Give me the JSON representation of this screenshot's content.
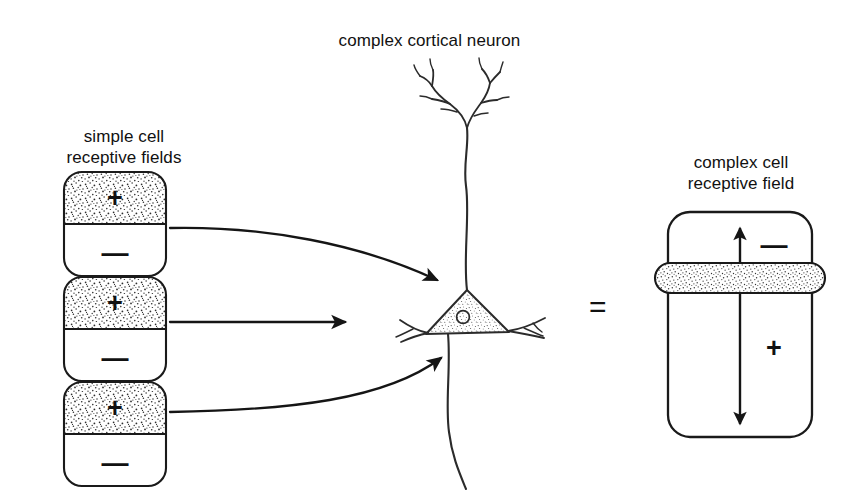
{
  "figure": {
    "title": "complex cortical neuron",
    "width": 859,
    "height": 500,
    "background": "#ffffff",
    "ink_color": "#1a1a1a",
    "stipple_color": "#3a3a3a"
  },
  "left_panel": {
    "label_line1": "simple cell",
    "label_line2": "receptive fields",
    "label": "simple cell\nreceptive fields",
    "count": 3,
    "fields": [
      {
        "excitatory_sign": "+",
        "inhibitory_sign": "—",
        "region_top": "excitatory",
        "region_bottom": "inhibitory"
      },
      {
        "excitatory_sign": "+",
        "inhibitory_sign": "—",
        "region_top": "excitatory",
        "region_bottom": "inhibitory"
      },
      {
        "excitatory_sign": "+",
        "inhibitory_sign": "—",
        "region_top": "excitatory",
        "region_bottom": "inhibitory"
      }
    ]
  },
  "center_panel": {
    "neuron_label": "complex cortical neuron",
    "parts": [
      "apical-dendrite",
      "dendritic-tree",
      "soma",
      "nucleus",
      "basal-dendrite-left",
      "basal-dendrite-right",
      "axon"
    ]
  },
  "arrows": {
    "count": 3,
    "items": [
      {
        "name": "projection-arrow-top",
        "shape": "curved-down"
      },
      {
        "name": "projection-arrow-middle",
        "shape": "straight"
      },
      {
        "name": "projection-arrow-bottom",
        "shape": "curved-up"
      }
    ]
  },
  "equals": {
    "symbol": "="
  },
  "right_panel": {
    "label_line1": "complex cell",
    "label_line2": "receptive field",
    "label": "complex cell\nreceptive field",
    "minus_sign": "—",
    "plus_sign": "+",
    "band": "stippled-bar",
    "axis_arrow": "double-headed-vertical"
  }
}
